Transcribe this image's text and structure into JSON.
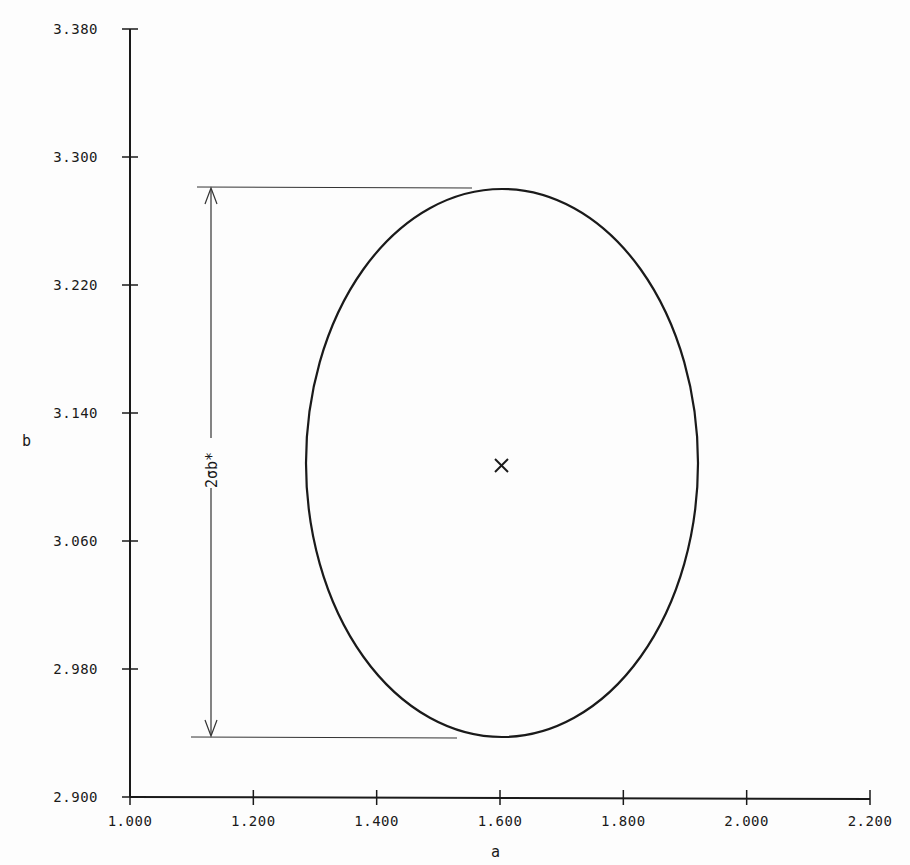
{
  "chart_data": {
    "type": "scatter",
    "title": "",
    "xlabel": "a",
    "ylabel": "b",
    "xlim": [
      1.0,
      2.2
    ],
    "ylim": [
      2.9,
      3.38
    ],
    "grid": false,
    "legend": null,
    "x_ticks": [
      "1.000",
      "1.200",
      "1.400",
      "1.600",
      "1.800",
      "2.000",
      "2.200"
    ],
    "y_ticks": [
      "2.900",
      "2.980",
      "3.060",
      "3.140",
      "3.220",
      "3.300",
      "3.380"
    ],
    "series": [
      {
        "name": "center-estimate",
        "marker": "x",
        "points": [
          {
            "a": 1.603,
            "b": 3.107
          }
        ]
      },
      {
        "name": "confidence-ellipse",
        "shape": "ellipse",
        "center": {
          "a": 1.603,
          "b": 3.107
        },
        "semi_axis_a": 0.319,
        "semi_axis_b": 0.172,
        "a_range": [
          1.284,
          1.922
        ],
        "b_range": [
          2.935,
          3.28
        ]
      }
    ],
    "annotations": [
      {
        "text": "2σb*",
        "type": "double-arrow dimension",
        "from_b": 2.935,
        "to_b": 3.28,
        "at_a": 1.13
      }
    ]
  },
  "labels": {
    "x_axis": "a",
    "y_axis": "b",
    "dimension": "2σb*"
  },
  "colors": {
    "ink": "#1a1a1a",
    "background": "#fdfdfd"
  }
}
